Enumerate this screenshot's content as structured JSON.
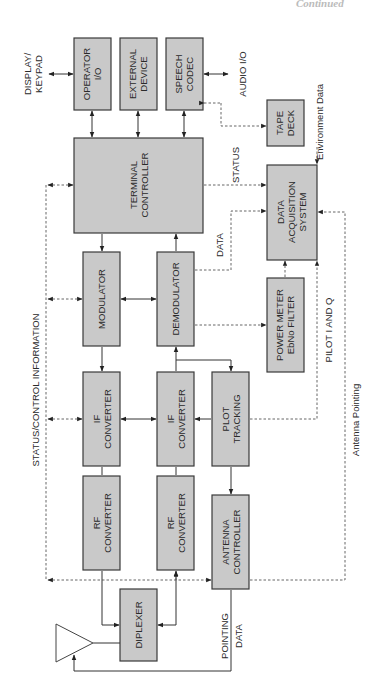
{
  "page": {
    "corner_text": "Continued"
  },
  "diagram": {
    "orientation": "rotated 90 degrees counter-clockwise",
    "blocks": {
      "operator_io": [
        "OPERATOR",
        "I/O"
      ],
      "external_device": [
        "EXTERNAL",
        "DEVICE"
      ],
      "speech_codec": [
        "SPEECH",
        "CODEC"
      ],
      "tape_deck": [
        "TAPE",
        "DECK"
      ],
      "terminal_controller": [
        "TERMINAL",
        "CONTROLLER"
      ],
      "data_acquisition": [
        "DATA",
        "ACQUISITION",
        "SYSTEM"
      ],
      "modulator": [
        "MODULATOR"
      ],
      "demodulator": [
        "DEMODULATOR"
      ],
      "power_meter": [
        "POWER METER",
        "EbNo FILTER"
      ],
      "if_converter_tx": [
        "IF",
        "CONVERTER"
      ],
      "if_converter_rx": [
        "IF",
        "CONVERTER"
      ],
      "plot_tracking": [
        "PLOT",
        "TRACKING"
      ],
      "rf_converter_tx": [
        "RF",
        "CONVERTER"
      ],
      "rf_converter_rx": [
        "RF",
        "CONVERTER"
      ],
      "antenna_controller": [
        "ANTENNA",
        "CONTROLLER"
      ],
      "diplexer": [
        "DIPLEXER"
      ]
    },
    "labels": {
      "display_keypad": [
        "DISPLAY/",
        "KEYPAD"
      ],
      "audio_io": "AUDIO I/O",
      "environment_data": "Environment Data",
      "status": "STATUS",
      "data": "DATA",
      "status_control": "STATUS/CONTROL INFORMATION",
      "pilot_iq": "PILOT I AND Q",
      "antenna_pointing": "Antenna Pointing",
      "pointing_data": [
        "POINTING",
        "DATA"
      ]
    }
  }
}
